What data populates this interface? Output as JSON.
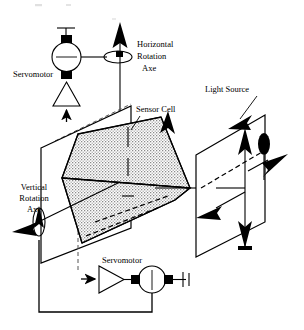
{
  "figure": {
    "type": "technical-schematic-diagram",
    "background_color": "#ffffff",
    "line_color": "#000000",
    "fill_pattern": "gray-stipple"
  },
  "labels": {
    "servomotor_top": "Servomotor",
    "horizontal_rotation_axe": "Horizontal\nRotation\nAxe",
    "horizontal_rotation_axe_line1": "Horizontal",
    "horizontal_rotation_axe_line2": "Rotation",
    "horizontal_rotation_axe_line3": "Axe",
    "sensor_cell": "Sensor Cell",
    "light_source": "Light Source",
    "vertical_rotation_axe_line1": "Vertical",
    "vertical_rotation_axe_line2": "Rotation",
    "vertical_rotation_axe_line3": "Axe",
    "servomotor_bottom": "Servomotor"
  },
  "components": {
    "motor_top": {
      "name": "top-servomotor-body",
      "shape": "circle",
      "terminals": "black-squares-top-bottom"
    },
    "amplifier_top": {
      "name": "top-amplifier",
      "shape": "triangle-pointing-up"
    },
    "motor_bottom": {
      "name": "bottom-servomotor-body",
      "shape": "circle",
      "terminals": "black-squares-left-right"
    },
    "amplifier_bottom": {
      "name": "bottom-amplifier",
      "shape": "triangle-pointing-right"
    },
    "sensor_plane": {
      "name": "sensor-mounting-plane",
      "shape": "parallelogram"
    },
    "sensor_wedge": {
      "name": "sensor-cell-cone",
      "shape": "converging-wedge",
      "fill": "stipple-gray"
    },
    "target_plane": {
      "name": "light-source-target-plane",
      "shape": "parallelogram"
    },
    "axis_ellipse_horizontal": {
      "name": "horizontal-axis-rotation-ellipse",
      "shape": "ellipse-horizontal"
    },
    "axis_ellipse_vertical": {
      "name": "vertical-axis-rotation-ellipse",
      "shape": "ellipse-vertical"
    },
    "light_blob": {
      "name": "light-source-emitter-blob",
      "shape": "filled-ellipse"
    }
  },
  "arrows": [
    {
      "name": "horizontal-axis-up-arrow",
      "direction": "up"
    },
    {
      "name": "top-amplifier-input-arrow",
      "direction": "up"
    },
    {
      "name": "vertical-axis-up-arrow",
      "direction": "up"
    },
    {
      "name": "vertical-axis-diagonal-arrow",
      "direction": "down-left"
    },
    {
      "name": "bottom-amplifier-input-arrow",
      "direction": "right"
    },
    {
      "name": "light-source-incoming-arrow",
      "direction": "down-left"
    },
    {
      "name": "target-plane-up-arrow",
      "direction": "up"
    },
    {
      "name": "target-plane-down-arrow",
      "direction": "down"
    },
    {
      "name": "target-plane-right-arrow",
      "direction": "right"
    },
    {
      "name": "target-plane-left-arrow",
      "direction": "down-left"
    },
    {
      "name": "optical-axis-arrow",
      "direction": "right"
    },
    {
      "name": "target-plane-upper-right-arrow",
      "direction": "right"
    }
  ]
}
